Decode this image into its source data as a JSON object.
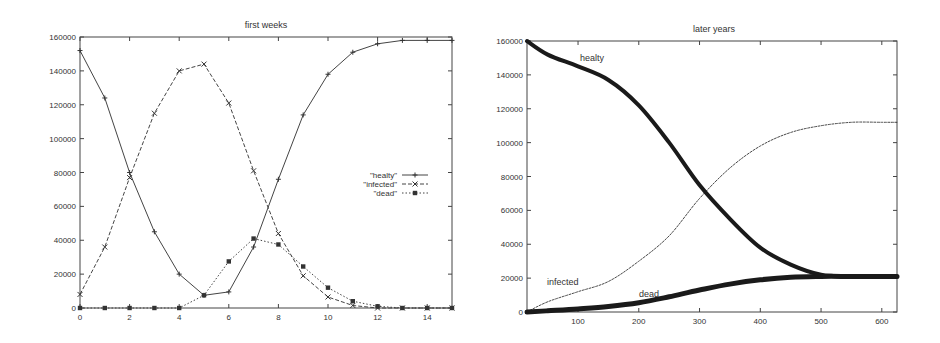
{
  "chart_data": [
    {
      "type": "line",
      "title": "first weeks",
      "xlabel": "",
      "ylabel": "",
      "xlim": [
        0,
        15
      ],
      "ylim": [
        0,
        160000
      ],
      "xticks": [
        0,
        2,
        4,
        6,
        8,
        10,
        12,
        14
      ],
      "yticks": [
        0,
        20000,
        40000,
        60000,
        80000,
        100000,
        120000,
        140000,
        160000
      ],
      "grid": false,
      "legend_position": "right-middle",
      "x": [
        0,
        1,
        2,
        3,
        4,
        5,
        6,
        7,
        8,
        9,
        10,
        11,
        12,
        13,
        14,
        15
      ],
      "series": [
        {
          "name": "\"healty\"",
          "style": "solid",
          "marker": "+",
          "values": [
            152000,
            124000,
            80000,
            45000,
            20000,
            7500,
            9500,
            36000,
            76000,
            114000,
            138000,
            151000,
            156000,
            158000,
            158000,
            158000
          ]
        },
        {
          "name": "\"infected\"",
          "style": "dashed",
          "marker": "x",
          "values": [
            8000,
            36000,
            77000,
            115000,
            140000,
            144000,
            121000,
            81000,
            44000,
            19000,
            6500,
            1500,
            0,
            0,
            0,
            0
          ]
        },
        {
          "name": "\"dead\"",
          "style": "dotted",
          "marker": "filled-square",
          "values": [
            0,
            0,
            0,
            0,
            0,
            7500,
            27500,
            41000,
            37500,
            24500,
            12000,
            4000,
            1000,
            0,
            0,
            0
          ]
        }
      ]
    },
    {
      "type": "line",
      "title": "later years",
      "xlabel": "",
      "ylabel": "",
      "xlim": [
        16,
        625
      ],
      "ylim": [
        0,
        160000
      ],
      "xticks": [
        100,
        200,
        300,
        400,
        500,
        600
      ],
      "yticks": [
        0,
        20000,
        40000,
        60000,
        80000,
        100000,
        120000,
        140000,
        160000
      ],
      "grid": false,
      "legend_position": "inline-labels",
      "x": [
        16,
        50,
        100,
        150,
        200,
        250,
        300,
        350,
        400,
        450,
        500,
        550,
        600,
        625
      ],
      "series": [
        {
          "name": "healty",
          "style": "thick-solid",
          "values": [
            160000,
            152000,
            145000,
            137000,
            122000,
            100000,
            75000,
            55000,
            38000,
            28000,
            22000,
            21000,
            21000,
            21000
          ]
        },
        {
          "name": "infected",
          "style": "thin-dashed",
          "values": [
            0,
            6000,
            12000,
            18000,
            30000,
            45000,
            67000,
            85000,
            98000,
            106000,
            110000,
            112000,
            112000,
            112000
          ]
        },
        {
          "name": "dead",
          "style": "thick-solid",
          "values": [
            0,
            700,
            1800,
            3300,
            5500,
            9000,
            13000,
            16500,
            19000,
            20500,
            21000,
            21000,
            21000,
            21000
          ]
        }
      ],
      "annotations": [
        {
          "text": "healty",
          "x": 130,
          "y": 149000
        },
        {
          "text": "infected",
          "x": 60,
          "y": 18000
        },
        {
          "text": "dead",
          "x": 230,
          "y": 11000
        }
      ]
    }
  ],
  "labels": {
    "left_title": "first weeks",
    "right_title": "later years",
    "legend_healty": "\"healty\"",
    "legend_infected": "\"infected\"",
    "legend_dead": "\"dead\"",
    "ann_healty": "healty",
    "ann_infected": "infected",
    "ann_dead": "dead"
  }
}
